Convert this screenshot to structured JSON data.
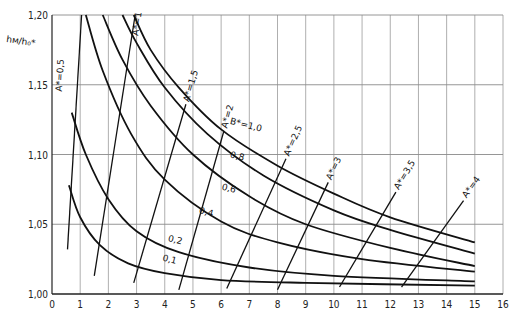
{
  "chart_data": {
    "type": "line",
    "title": "",
    "xlabel": "",
    "ylabel": "h_M/h_0*",
    "xlim": [
      0,
      16
    ],
    "ylim": [
      1.0,
      1.2
    ],
    "x_ticks": [
      "0",
      "1",
      "2",
      "3",
      "4",
      "5",
      "6",
      "7",
      "8",
      "9",
      "10",
      "11",
      "12",
      "13",
      "14",
      "15",
      "16"
    ],
    "y_ticks": [
      "1,00",
      "1,05",
      "1,10",
      "1,15",
      "1,20"
    ],
    "grid": true,
    "legend_position": "inline labels",
    "series": [
      {
        "name": "B* = 1,0",
        "label": "B*=1,0",
        "points": [
          [
            2.9,
            1.2
          ],
          [
            3.5,
            1.175
          ],
          [
            4.5,
            1.148
          ],
          [
            6,
            1.118
          ],
          [
            8,
            1.092
          ],
          [
            10,
            1.072
          ],
          [
            12,
            1.055
          ],
          [
            15,
            1.037
          ]
        ]
      },
      {
        "name": "0,8",
        "label": "0,8",
        "points": [
          [
            2.5,
            1.2
          ],
          [
            3,
            1.18
          ],
          [
            4,
            1.148
          ],
          [
            5.5,
            1.115
          ],
          [
            7.5,
            1.085
          ],
          [
            10,
            1.06
          ],
          [
            12,
            1.046
          ],
          [
            15,
            1.029
          ]
        ]
      },
      {
        "name": "0,6",
        "label": "0,6",
        "points": [
          [
            1.8,
            1.2
          ],
          [
            2.5,
            1.168
          ],
          [
            3.5,
            1.135
          ],
          [
            5,
            1.1
          ],
          [
            7,
            1.07
          ],
          [
            9,
            1.05
          ],
          [
            12,
            1.033
          ],
          [
            15,
            1.02
          ]
        ]
      },
      {
        "name": "0,4",
        "label": "0,4",
        "points": [
          [
            1.2,
            1.2
          ],
          [
            1.8,
            1.16
          ],
          [
            2.8,
            1.115
          ],
          [
            4,
            1.082
          ],
          [
            6,
            1.052
          ],
          [
            8,
            1.037
          ],
          [
            11,
            1.025
          ],
          [
            15,
            1.016
          ]
        ]
      },
      {
        "name": "0,2",
        "label": "0,2",
        "points": [
          [
            0.7,
            1.13
          ],
          [
            1.2,
            1.1
          ],
          [
            2,
            1.068
          ],
          [
            3,
            1.045
          ],
          [
            4.5,
            1.03
          ],
          [
            7,
            1.019
          ],
          [
            10,
            1.013
          ],
          [
            15,
            1.009
          ]
        ]
      },
      {
        "name": "0,1",
        "label": "0,1",
        "points": [
          [
            0.6,
            1.078
          ],
          [
            1,
            1.055
          ],
          [
            1.7,
            1.035
          ],
          [
            2.7,
            1.022
          ],
          [
            4,
            1.015
          ],
          [
            6,
            1.01
          ],
          [
            9,
            1.008
          ],
          [
            15,
            1.006
          ]
        ]
      }
    ],
    "iso_lines": [
      {
        "label": "A*=0,5",
        "from": [
          0.55,
          1.032
        ],
        "to": [
          1.05,
          1.2
        ]
      },
      {
        "label": "A*=1",
        "from": [
          1.5,
          1.013
        ],
        "to": [
          2.95,
          1.2
        ]
      },
      {
        "label": "A*=1,5",
        "from": [
          2.9,
          1.008
        ],
        "to": [
          4.75,
          1.136
        ]
      },
      {
        "label": "A*=2",
        "from": [
          4.5,
          1.003
        ],
        "to": [
          6.1,
          1.117
        ]
      },
      {
        "label": "A*=2,5",
        "from": [
          6.2,
          1.004
        ],
        "to": [
          8.3,
          1.097
        ]
      },
      {
        "label": "A*=3",
        "from": [
          8.0,
          1.003
        ],
        "to": [
          9.8,
          1.08
        ]
      },
      {
        "label": "A*=3,5",
        "from": [
          10.2,
          1.005
        ],
        "to": [
          12.2,
          1.073
        ]
      },
      {
        "label": "A*=4",
        "from": [
          12.4,
          1.005
        ],
        "to": [
          14.6,
          1.067
        ]
      }
    ]
  },
  "labels": {
    "ylabel": "hм/h₀*",
    "curves": [
      "B*=1,0",
      "0,8",
      "0,6",
      "0,4",
      "0,2",
      "0,1"
    ],
    "iso": [
      "A*=0,5",
      "A*=1",
      "A*=1,5",
      "A*=2",
      "A*=2,5",
      "A*=3",
      "A*=3,5",
      "A*=4"
    ]
  }
}
